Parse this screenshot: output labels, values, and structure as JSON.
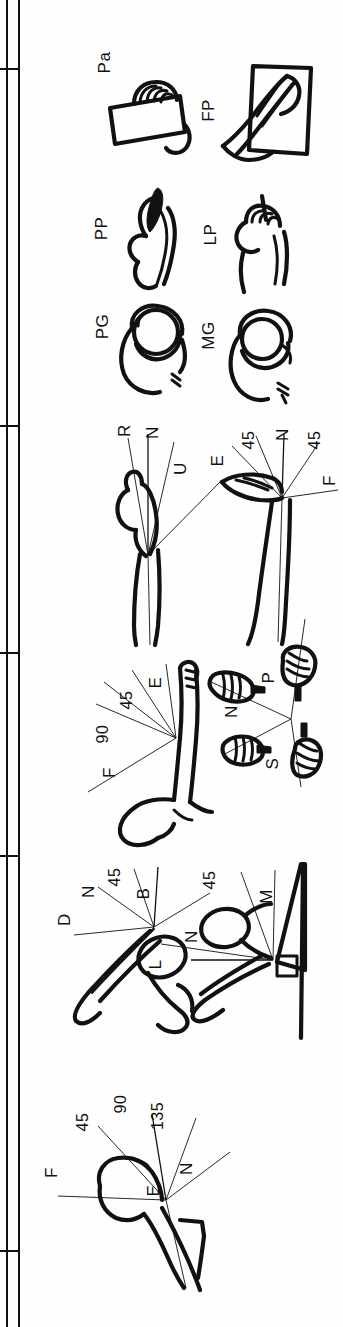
{
  "figure": {
    "orientation": "rotated-90-ccw",
    "background_color": "#ffffff",
    "ink_color": "#111111",
    "page_width": 343,
    "page_height": 1327
  },
  "frame": {
    "name": "table-left-border",
    "rule_x": 18,
    "row_separator_y": [
      68,
      425,
      652,
      855,
      1250
    ]
  },
  "panels": [
    {
      "id": "grip-rectangular",
      "name": "grip-type-palmar",
      "label": "Pa",
      "caption_meaning": "Palmar grip"
    },
    {
      "id": "grip-flat-palm",
      "name": "grip-type-flat-palm",
      "label": "FP",
      "caption_meaning": "Flat palm / push"
    },
    {
      "id": "grip-pulp-pinch",
      "name": "grip-type-pulp-pinch",
      "label": "PP",
      "caption_meaning": "Pulp pinch"
    },
    {
      "id": "grip-lateral-pinch",
      "name": "grip-type-lateral-pinch",
      "label": "LP",
      "caption_meaning": "Lateral pinch"
    },
    {
      "id": "grip-power",
      "name": "grip-type-power-grip",
      "label": "PG",
      "caption_meaning": "Power grip"
    },
    {
      "id": "grip-medium-wrap",
      "name": "grip-type-medium-wrap",
      "label": "MG",
      "caption_meaning": "Medium wrap grip"
    },
    {
      "id": "wrist-deviation",
      "name": "joint-wrist-deviation",
      "labels": [
        "R",
        "N",
        "U"
      ],
      "caption_meaning": "Wrist radial / neutral / ulnar deviation"
    },
    {
      "id": "wrist-flexion",
      "name": "joint-wrist-flexion-extension",
      "labels": [
        "E",
        "45",
        "N",
        "45",
        "F"
      ],
      "caption_meaning": "Wrist extension / neutral / flexion"
    },
    {
      "id": "elbow-flexion",
      "name": "joint-elbow-flexion",
      "labels": [
        "F",
        "90",
        "45",
        "E"
      ],
      "caption_meaning": "Elbow flexion / extension"
    },
    {
      "id": "forearm-rotation",
      "name": "joint-forearm-rotation",
      "labels": [
        "P",
        "N",
        "S"
      ],
      "caption_meaning": "Forearm pronation / neutral / supination"
    },
    {
      "id": "shoulder-abduction",
      "name": "joint-shoulder-abduction",
      "labels": [
        "D",
        "N",
        "45",
        "B"
      ],
      "caption_meaning": "Shoulder adduction / neutral / abduction / back"
    },
    {
      "id": "shoulder-rotation",
      "name": "joint-shoulder-lateral-medial",
      "labels": [
        "L",
        "N",
        "45",
        "M"
      ],
      "caption_meaning": "Shoulder lateral / neutral / medial rotation"
    },
    {
      "id": "shoulder-flexion",
      "name": "joint-shoulder-flexion",
      "labels": [
        "F",
        "45",
        "90",
        "135",
        "N",
        "E"
      ],
      "caption_meaning": "Shoulder flexion angles / neutral / extension"
    }
  ],
  "labels": {
    "pa": "Pa",
    "fp": "FP",
    "pp": "PP",
    "lp": "LP",
    "pg": "PG",
    "mg": "MG",
    "wrist_r": "R",
    "wrist_n": "N",
    "wrist_u": "U",
    "wf_e": "E",
    "wf_45a": "45",
    "wf_n": "N",
    "wf_45b": "45",
    "wf_f": "F",
    "el_f": "F",
    "el_90": "90",
    "el_45": "45",
    "el_e": "E",
    "fa_p": "P",
    "fa_n": "N",
    "fa_s": "S",
    "sa_d": "D",
    "sa_n": "N",
    "sa_45": "45",
    "sa_b": "B",
    "sr_l": "L",
    "sr_n": "N",
    "sr_45": "45",
    "sr_m": "M",
    "sf_f": "F",
    "sf_45": "45",
    "sf_90": "90",
    "sf_135": "135",
    "sf_n": "N",
    "sf_e": "E"
  }
}
